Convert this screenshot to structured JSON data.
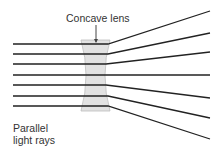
{
  "diagram": {
    "labels": {
      "lens": "Concave lens",
      "rays": "Parallel\nlight rays"
    },
    "colors": {
      "background": "#ffffff",
      "ray": "#222222",
      "lens_fill": "#e2e2e2",
      "lens_stroke": "#bdbdbd",
      "text": "#333333"
    },
    "lens": {
      "top_y": 40,
      "bottom_y": 111,
      "outer_left_x": 81,
      "outer_right_x": 110,
      "waist_left_x": 88,
      "waist_right_x": 103
    },
    "rays": [
      {
        "y_in": 44,
        "x_start": 13,
        "x_lens_out": 108,
        "x_end": 210,
        "y_end": 11
      },
      {
        "y_in": 54,
        "x_start": 13,
        "x_lens_out": 108,
        "x_end": 210,
        "y_end": 33
      },
      {
        "y_in": 64,
        "x_start": 13,
        "x_lens_out": 106,
        "x_end": 210,
        "y_end": 52
      },
      {
        "y_in": 75,
        "x_start": 13,
        "x_lens_out": 106,
        "x_end": 210,
        "y_end": 75
      },
      {
        "y_in": 85,
        "x_start": 13,
        "x_lens_out": 106,
        "x_end": 210,
        "y_end": 98
      },
      {
        "y_in": 96,
        "x_start": 13,
        "x_lens_out": 108,
        "x_end": 210,
        "y_end": 118
      },
      {
        "y_in": 106,
        "x_start": 13,
        "x_lens_out": 108,
        "x_end": 210,
        "y_end": 139
      }
    ],
    "leader": {
      "x": 96,
      "y1": 25,
      "y2": 42
    }
  }
}
